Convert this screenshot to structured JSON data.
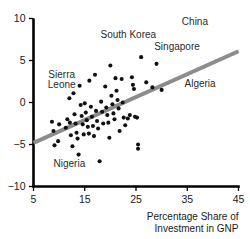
{
  "chart_data": {
    "type": "scatter",
    "title": "",
    "xlabel": "Percentage Share of Investment in GNP",
    "ylabel": "",
    "xlim": [
      5,
      45
    ],
    "ylim": [
      -10,
      10
    ],
    "xticks": [
      5,
      15,
      25,
      35,
      45
    ],
    "yticks": [
      -10,
      -5,
      0,
      5,
      10
    ],
    "xtick_labels": [
      "5",
      "15",
      "25",
      "35",
      "45"
    ],
    "ytick_labels": [
      "−10",
      "−5",
      "0",
      "5",
      "10"
    ],
    "grid": false,
    "legend": "none",
    "annotations": [
      {
        "text": "China",
        "x": 36.5,
        "y": 9.2
      },
      {
        "text": "South Korea",
        "x": 23.5,
        "y": 7.7
      },
      {
        "text": "Singapore",
        "x": 33.0,
        "y": 6.3
      },
      {
        "text": "Algeria",
        "x": 37.5,
        "y": 1.9
      },
      {
        "text": "Sierra",
        "x": 10.5,
        "y": 2.9
      },
      {
        "text": "Leone",
        "x": 10.5,
        "y": 1.7
      },
      {
        "text": "Nigeria",
        "x": 12.0,
        "y": -7.7
      }
    ],
    "trendline": {
      "x": [
        5,
        45
      ],
      "y": [
        -4.8,
        6.1
      ],
      "color": "#8c8c8c",
      "width": 4
    },
    "points": [
      {
        "x": 8.6,
        "y": -2.3
      },
      {
        "x": 8.9,
        "y": -3.4
      },
      {
        "x": 9.1,
        "y": -5.1
      },
      {
        "x": 9.8,
        "y": -4.6
      },
      {
        "x": 10.0,
        "y": -2.6
      },
      {
        "x": 11.3,
        "y": -3.0
      },
      {
        "x": 11.6,
        "y": -2.0
      },
      {
        "x": 12.0,
        "y": 0.5
      },
      {
        "x": 12.1,
        "y": -2.4
      },
      {
        "x": 12.3,
        "y": -3.9
      },
      {
        "x": 12.6,
        "y": -5.2
      },
      {
        "x": 12.8,
        "y": 1.1
      },
      {
        "x": 13.0,
        "y": -1.4
      },
      {
        "x": 13.2,
        "y": -2.5
      },
      {
        "x": 13.4,
        "y": -3.6
      },
      {
        "x": 13.6,
        "y": -4.3
      },
      {
        "x": 13.8,
        "y": -6.2
      },
      {
        "x": 14.0,
        "y": 2.0
      },
      {
        "x": 14.2,
        "y": -0.3
      },
      {
        "x": 14.4,
        "y": -1.6
      },
      {
        "x": 14.6,
        "y": -2.6
      },
      {
        "x": 14.8,
        "y": -3.8
      },
      {
        "x": 15.0,
        "y": -0.1
      },
      {
        "x": 15.2,
        "y": -1.2
      },
      {
        "x": 15.4,
        "y": -2.1
      },
      {
        "x": 15.6,
        "y": -2.9
      },
      {
        "x": 15.8,
        "y": -3.7
      },
      {
        "x": 15.9,
        "y": 2.6
      },
      {
        "x": 16.2,
        "y": -0.5
      },
      {
        "x": 16.4,
        "y": -1.7
      },
      {
        "x": 16.6,
        "y": -2.8
      },
      {
        "x": 16.8,
        "y": -4.0
      },
      {
        "x": 17.0,
        "y": 3.3
      },
      {
        "x": 17.2,
        "y": -1.0
      },
      {
        "x": 17.4,
        "y": -2.2
      },
      {
        "x": 17.6,
        "y": -3.1
      },
      {
        "x": 17.9,
        "y": -7.0
      },
      {
        "x": 18.2,
        "y": 0.1
      },
      {
        "x": 18.4,
        "y": -1.1
      },
      {
        "x": 18.6,
        "y": -2.5
      },
      {
        "x": 19.0,
        "y": 1.9
      },
      {
        "x": 19.2,
        "y": -0.6
      },
      {
        "x": 19.4,
        "y": -1.5
      },
      {
        "x": 19.6,
        "y": -2.4
      },
      {
        "x": 19.8,
        "y": -4.2
      },
      {
        "x": 20.0,
        "y": 4.4
      },
      {
        "x": 20.2,
        "y": 0.8
      },
      {
        "x": 20.4,
        "y": -0.2
      },
      {
        "x": 20.6,
        "y": -1.3
      },
      {
        "x": 20.8,
        "y": -2.0
      },
      {
        "x": 21.0,
        "y": 2.9
      },
      {
        "x": 21.2,
        "y": 1.4
      },
      {
        "x": 21.4,
        "y": 0.3
      },
      {
        "x": 21.6,
        "y": -0.7
      },
      {
        "x": 21.8,
        "y": -3.4
      },
      {
        "x": 22.2,
        "y": 2.8
      },
      {
        "x": 22.4,
        "y": 0.0
      },
      {
        "x": 22.6,
        "y": -1.8
      },
      {
        "x": 22.9,
        "y": -2.7
      },
      {
        "x": 23.4,
        "y": -1.9
      },
      {
        "x": 23.8,
        "y": -1.5
      },
      {
        "x": 24.2,
        "y": 3.0
      },
      {
        "x": 24.4,
        "y": 2.1
      },
      {
        "x": 24.6,
        "y": 1.6
      },
      {
        "x": 24.8,
        "y": -1.7
      },
      {
        "x": 25.2,
        "y": -1.8
      },
      {
        "x": 25.4,
        "y": -5.0
      },
      {
        "x": 25.4,
        "y": -5.5
      },
      {
        "x": 26.0,
        "y": 5.4
      },
      {
        "x": 27.0,
        "y": 2.4
      },
      {
        "x": 28.2,
        "y": 1.8
      },
      {
        "x": 29.0,
        "y": 4.6
      },
      {
        "x": 30.0,
        "y": 1.5
      }
    ]
  }
}
